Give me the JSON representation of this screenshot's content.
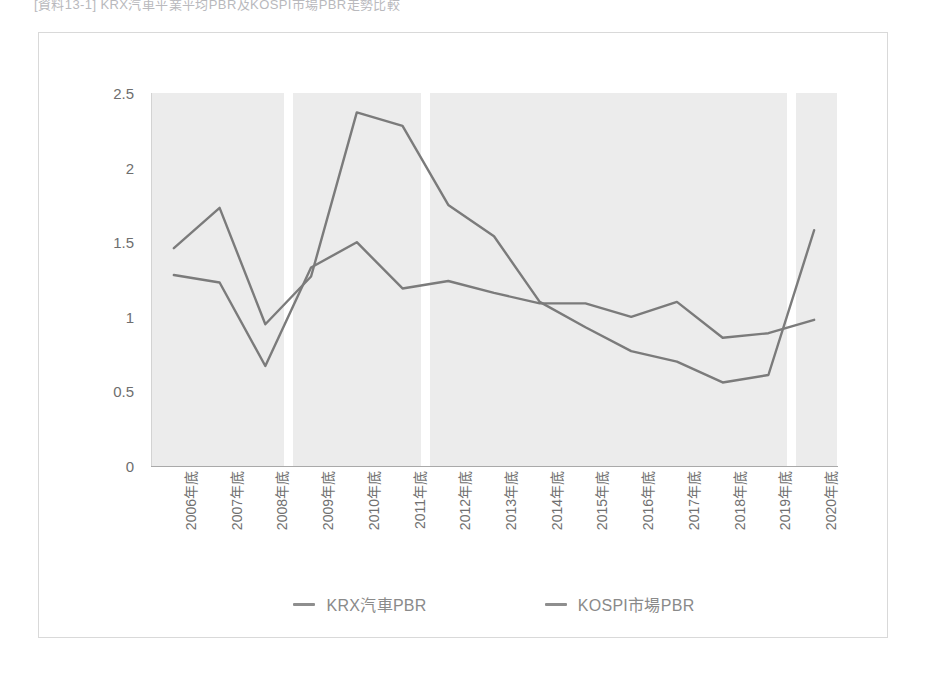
{
  "caption": "[資料13-1] KRX汽車平業平均PBR及KOSPI市場PBR走勢比較",
  "chart_data": {
    "type": "line",
    "title": "",
    "xlabel": "",
    "ylabel": "",
    "ylim": [
      0,
      2.5
    ],
    "yticks": [
      "0",
      "0.5",
      "1",
      "1.5",
      "2",
      "2.5"
    ],
    "ytick_values": [
      0,
      0.5,
      1,
      1.5,
      2,
      2.5
    ],
    "grid": "vertical-band-separators",
    "legend_position": "bottom-center",
    "plot_background": "#ececec",
    "categories": [
      "2006年底",
      "2007年底",
      "2008年底",
      "2009年底",
      "2010年底",
      "2011年底",
      "2012年底",
      "2013年底",
      "2014年底",
      "2015年底",
      "2016年底",
      "2017年底",
      "2018年底",
      "2019年底",
      "2020年底"
    ],
    "series": [
      {
        "name": "KRX汽車PBR",
        "color": "#7b7b7b",
        "values": [
          1.28,
          1.23,
          0.67,
          1.33,
          1.5,
          1.19,
          1.24,
          1.16,
          1.09,
          1.09,
          1.0,
          1.1,
          0.86,
          0.89,
          0.98
        ]
      },
      {
        "name": "KOSPI市場PBR",
        "color": "#7b7b7b",
        "values": [
          1.46,
          1.73,
          0.95,
          1.27,
          2.37,
          2.28,
          1.75,
          1.54,
          1.1,
          0.93,
          0.77,
          0.7,
          0.56,
          0.61,
          1.58
        ]
      }
    ],
    "band_separators_after": [
      2,
      5,
      13
    ]
  },
  "legend": {
    "items": [
      {
        "label": "KRX汽車PBR",
        "swatch_color": "#8e8e8e"
      },
      {
        "label": "KOSPI市場PBR",
        "swatch_color": "#8e8e8e"
      }
    ]
  }
}
